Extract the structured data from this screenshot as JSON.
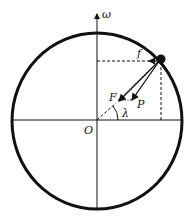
{
  "diagram": {
    "labels": {
      "axis": "ω",
      "origin": "O",
      "friction": "f",
      "force_f": "F",
      "force_p": "P",
      "angle": "λ"
    },
    "colors": {
      "stroke": "#111111",
      "background": "#ffffff"
    }
  }
}
